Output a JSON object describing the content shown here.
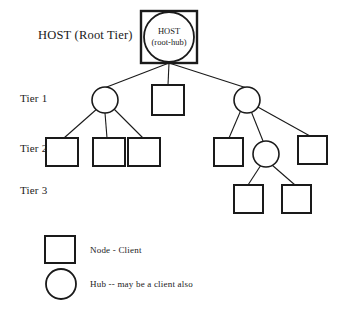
{
  "diagram": {
    "title_label": "HOST (Root Tier)",
    "tier_labels": [
      {
        "id": "tier-1",
        "text": "Tier 1",
        "x": 20,
        "y": 93
      },
      {
        "id": "tier-2",
        "text": "Tier 2",
        "x": 20,
        "y": 143
      },
      {
        "id": "tier-3",
        "text": "Tier 3",
        "x": 20,
        "y": 185
      }
    ],
    "root": {
      "caption_line1": "HOST",
      "caption_line2": "(root-hub)",
      "square": {
        "x": 141,
        "y": 11,
        "w": 56,
        "h": 52
      },
      "circle": {
        "cx": 169,
        "cy": 37,
        "r": 25
      }
    },
    "nodes": [
      {
        "id": "tier1-hub-left",
        "shape": "circle",
        "cx": 105,
        "cy": 100,
        "r": 13
      },
      {
        "id": "tier1-square-mid",
        "shape": "square",
        "x": 152,
        "y": 85,
        "w": 32,
        "h": 30
      },
      {
        "id": "tier1-hub-right",
        "shape": "circle",
        "cx": 247,
        "cy": 100,
        "r": 13
      },
      {
        "id": "tier2-square-1",
        "shape": "square",
        "x": 46,
        "y": 138,
        "w": 32,
        "h": 28
      },
      {
        "id": "tier2-square-2",
        "shape": "square",
        "x": 93,
        "y": 138,
        "w": 32,
        "h": 28
      },
      {
        "id": "tier2-square-3",
        "shape": "square",
        "x": 128,
        "y": 138,
        "w": 32,
        "h": 28
      },
      {
        "id": "tier2-square-4",
        "shape": "square",
        "x": 214,
        "y": 138,
        "w": 29,
        "h": 28
      },
      {
        "id": "tier2-hub-mid",
        "shape": "circle",
        "cx": 266,
        "cy": 154,
        "r": 13
      },
      {
        "id": "tier2-square-5",
        "shape": "square",
        "x": 298,
        "y": 136,
        "w": 29,
        "h": 28
      },
      {
        "id": "tier3-square-1",
        "shape": "square",
        "x": 234,
        "y": 185,
        "w": 29,
        "h": 28
      },
      {
        "id": "tier3-square-2",
        "shape": "square",
        "x": 282,
        "y": 185,
        "w": 29,
        "h": 28
      }
    ],
    "edges": [
      {
        "id": "root-to-tier1-hub-left",
        "x1": 169,
        "y1": 63,
        "x2": 99,
        "y2": 90
      },
      {
        "id": "root-to-tier1-square-mid",
        "x1": 169,
        "y1": 63,
        "x2": 168,
        "y2": 85
      },
      {
        "id": "root-to-tier1-hub-right",
        "x1": 169,
        "y1": 63,
        "x2": 253,
        "y2": 90
      },
      {
        "id": "tier1-hub-left-to-square-1",
        "x1": 98,
        "y1": 108,
        "x2": 64,
        "y2": 138
      },
      {
        "id": "tier1-hub-left-to-square-2",
        "x1": 105,
        "y1": 113,
        "x2": 107,
        "y2": 138
      },
      {
        "id": "tier1-hub-left-to-square-3",
        "x1": 113,
        "y1": 108,
        "x2": 143,
        "y2": 138
      },
      {
        "id": "tier1-hub-right-to-square-4",
        "x1": 241,
        "y1": 110,
        "x2": 229,
        "y2": 138
      },
      {
        "id": "tier1-hub-right-to-hub-mid",
        "x1": 251,
        "y1": 111,
        "x2": 263,
        "y2": 141
      },
      {
        "id": "tier1-hub-right-to-square-5",
        "x1": 256,
        "y1": 106,
        "x2": 310,
        "y2": 136
      },
      {
        "id": "tier2-hub-mid-to-tier3-square-1",
        "x1": 261,
        "y1": 165,
        "x2": 248,
        "y2": 185
      },
      {
        "id": "tier2-hub-mid-to-tier3-square-2",
        "x1": 272,
        "y1": 165,
        "x2": 295,
        "y2": 185
      }
    ],
    "legend": {
      "items": [
        {
          "id": "legend-node",
          "shape": "square",
          "text": "Node - Client",
          "swatch": {
            "x": 45,
            "y": 236,
            "w": 30,
            "h": 27
          },
          "label_x": 90,
          "label_y": 246
        },
        {
          "id": "legend-hub",
          "shape": "circle",
          "text": "Hub -- may be a client also",
          "swatch": {
            "cx": 61,
            "cy": 284,
            "r": 15
          },
          "label_x": 90,
          "label_y": 280
        }
      ]
    },
    "colors": {
      "stroke": "#1a1a1a",
      "fill": "#ffffff",
      "text": "#1a1a1a",
      "background": "#ffffff"
    },
    "root_title_pos": {
      "x": 38,
      "y": 29
    }
  }
}
